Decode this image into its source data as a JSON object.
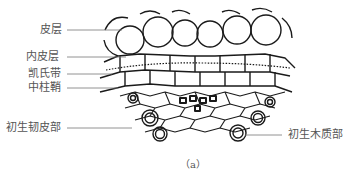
{
  "figure": {
    "caption": "（a）",
    "labels_left": [
      {
        "id": "cortex",
        "text": "皮层"
      },
      {
        "id": "endodermis",
        "text": "内皮层"
      },
      {
        "id": "casparian-strip",
        "text": "凯氏带"
      },
      {
        "id": "pericycle",
        "text": "中柱鞘"
      },
      {
        "id": "primary-phloem",
        "text": "初生韧皮部"
      }
    ],
    "labels_right": [
      {
        "id": "primary-xylem",
        "text": "初生木质部"
      }
    ],
    "colors": {
      "ink": "#1a1a1a",
      "label": "#555555",
      "leader": "#777777"
    }
  }
}
